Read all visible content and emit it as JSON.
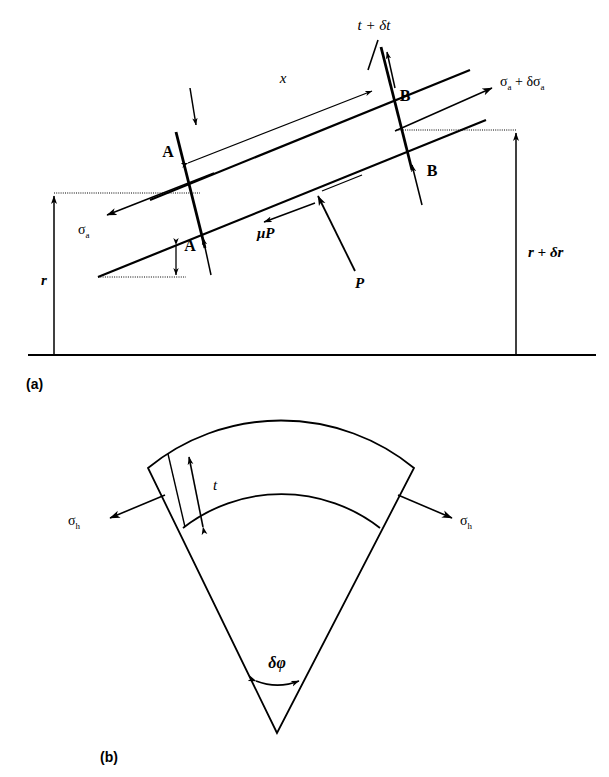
{
  "figure": {
    "panels": [
      {
        "id": "a",
        "caption": "(a)",
        "description": "Force balance on an element of an inclined wall",
        "labels": {
          "thickness_increment": "t + δt",
          "axial_stress_left": "σ",
          "axial_stress_left_sub": "a",
          "axial_stress_right": "σ",
          "axial_stress_right_sub": "a",
          "axial_stress_right_plus": " + δσ",
          "axial_stress_right_plus_sub": "a",
          "element_length": "x",
          "friction_force": "μP",
          "normal_force": "P",
          "radius_inner": "r",
          "radius_outer": "r + δr",
          "corner_top_left": "A",
          "corner_bottom_left": "A",
          "corner_top_right": "B",
          "corner_bottom_right": "B"
        }
      },
      {
        "id": "b",
        "caption": "(b)",
        "description": "Sector of the shell showing hoop stresses",
        "labels": {
          "hoop_stress_left": "σ",
          "hoop_stress_left_sub": "h",
          "hoop_stress_right": "σ",
          "hoop_stress_right_sub": "h",
          "wall_thickness": "t",
          "included_angle": "δφ"
        }
      }
    ],
    "style": {
      "line_color": "#000000",
      "background": "#ffffff",
      "thin_stroke": 1.2,
      "thick_stroke": 2.6
    }
  }
}
